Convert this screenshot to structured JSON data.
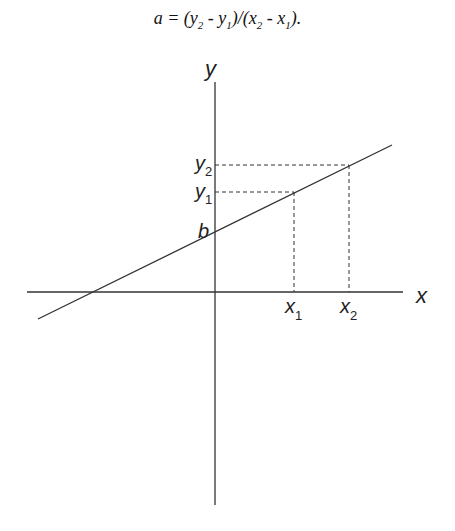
{
  "formula": {
    "text": "a = (y2 - y1)/(x2 - x1).",
    "lhs": "a",
    "eq": " = ",
    "p1": "(y",
    "s1": "2",
    "m1": " - y",
    "s2": "1",
    "p2": ")/(x",
    "s3": "2",
    "m2": " - x",
    "s4": "1",
    "p3": ")."
  },
  "axes": {
    "x_label": "x",
    "y_label": "y"
  },
  "labels": {
    "b": "b",
    "y1": "y",
    "y1_sub": "1",
    "y2": "y",
    "y2_sub": "2",
    "x1": "x",
    "x1_sub": "1",
    "x2": "x",
    "x2_sub": "2"
  }
}
